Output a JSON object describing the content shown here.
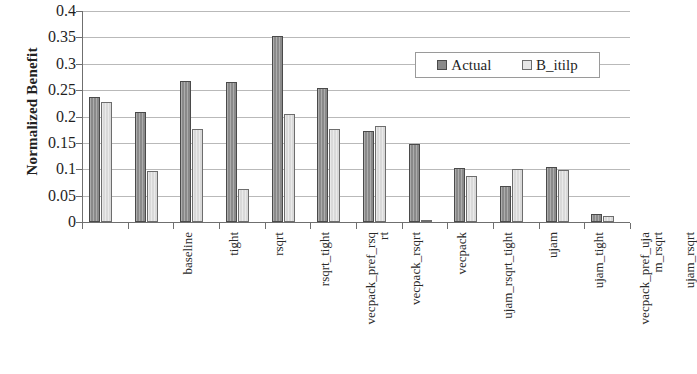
{
  "chart_data": {
    "type": "bar",
    "title": "",
    "xlabel": "",
    "ylabel": "Normalized Benefit",
    "ylim": [
      0,
      0.4
    ],
    "grid": true,
    "legend_position": "upper-right-inside",
    "ytick_labels": [
      "0.4",
      "0.35",
      "0.3",
      "0.25",
      "0.2",
      "0.15",
      "0.1",
      "0.05",
      "0"
    ],
    "ytick_values": [
      0.4,
      0.35,
      0.3,
      0.25,
      0.2,
      0.15,
      0.1,
      0.05,
      0
    ],
    "categories": [
      "baseline",
      "tight",
      "rsqrt",
      "rsqrt_tight",
      "vecpack_pref_rsqrt",
      "vecpack_rsqrt",
      "vecpack",
      "ujam_rsqrt_tight",
      "ujam",
      "ujam_tight",
      "vecpack_pref_ujam_rsqrt",
      "ujam_rsqrt"
    ],
    "category_label_lines": [
      [
        "baseline",
        ""
      ],
      [
        "tight",
        ""
      ],
      [
        "rsqrt",
        ""
      ],
      [
        "rsqrt_tight",
        ""
      ],
      [
        "vecpack_pref_rsq",
        "rt"
      ],
      [
        "vecpack_rsqrt",
        ""
      ],
      [
        "vecpack",
        ""
      ],
      [
        "ujam_rsqrt_tight",
        ""
      ],
      [
        "ujam",
        ""
      ],
      [
        "ujam_tight",
        ""
      ],
      [
        "vecpack_pref_uja",
        "m_rsqrt"
      ],
      [
        "ujam_rsqrt",
        ""
      ]
    ],
    "series": [
      {
        "name": "Actual",
        "color": "#8a8a8a",
        "values": [
          0.237,
          0.208,
          0.267,
          0.265,
          0.353,
          0.255,
          0.172,
          0.148,
          0.103,
          0.068,
          0.105,
          0.015
        ]
      },
      {
        "name": "B_itilp",
        "color": "#d9d9d9",
        "values": [
          0.228,
          0.096,
          0.176,
          0.063,
          0.205,
          0.176,
          0.182,
          0.004,
          0.088,
          0.1,
          0.098,
          0.012
        ]
      }
    ]
  },
  "legend": {
    "entries": [
      {
        "label": "Actual"
      },
      {
        "label": "B_itilp"
      }
    ]
  }
}
